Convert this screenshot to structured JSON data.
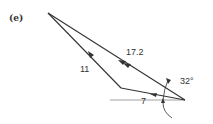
{
  "figure": {
    "part_label": "(e)",
    "colors": {
      "line": "#333333",
      "reference_line": "#888888",
      "background": "#ffffff"
    },
    "vectors": [
      {
        "id": "resultant",
        "label": "17.2",
        "arrowheads": 2
      },
      {
        "id": "vector-11",
        "label": "11",
        "arrowheads": 1
      },
      {
        "id": "vector-7",
        "label": "7",
        "arrowheads": 1
      }
    ],
    "angles": [
      {
        "id": "angle-32",
        "label": "32°"
      }
    ]
  }
}
